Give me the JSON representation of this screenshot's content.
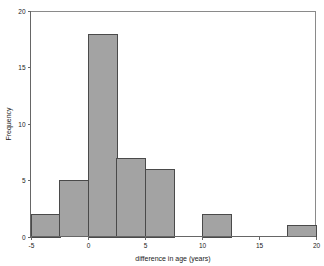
{
  "chart_data": {
    "type": "bar",
    "title": "",
    "subtitle": "",
    "xlabel": "difference in age (years)",
    "ylabel": "Frequency",
    "xlim": [
      -5,
      20
    ],
    "ylim": [
      0,
      20
    ],
    "xticks": [
      -5,
      0,
      5,
      10,
      15,
      20
    ],
    "xtick_labels": [
      "-5",
      "0",
      "5",
      "10",
      "15",
      "20"
    ],
    "yticks": [
      0,
      5,
      10,
      15,
      20
    ],
    "ytick_labels": [
      "0",
      "5",
      "10",
      "15",
      "20"
    ],
    "grid": false,
    "legend": null,
    "bin_width": 2.5,
    "bin_edges": [
      -5,
      -2.5,
      0,
      2.5,
      5,
      7.5,
      10,
      12.5,
      15,
      17.5,
      20
    ],
    "categories": [
      "-5 to -2.5",
      "-2.5 to 0",
      "0 to 2.5",
      "2.5 to 5",
      "5 to 7.5",
      "7.5 to 10",
      "10 to 12.5",
      "12.5 to 15",
      "15 to 17.5",
      "17.5 to 20"
    ],
    "values": [
      2,
      5,
      18,
      7,
      6,
      0,
      2,
      0,
      0,
      1
    ],
    "bars": [
      {
        "x0": -5,
        "x1": -2.5,
        "value": 2
      },
      {
        "x0": -2.5,
        "x1": 0,
        "value": 5
      },
      {
        "x0": 0,
        "x1": 2.5,
        "value": 18
      },
      {
        "x0": 2.5,
        "x1": 5,
        "value": 7
      },
      {
        "x0": 5,
        "x1": 7.5,
        "value": 6
      },
      {
        "x0": 7.5,
        "x1": 10,
        "value": 0
      },
      {
        "x0": 10,
        "x1": 12.5,
        "value": 2
      },
      {
        "x0": 12.5,
        "x1": 15,
        "value": 0
      },
      {
        "x0": 15,
        "x1": 17.5,
        "value": 0
      },
      {
        "x0": 17.5,
        "x1": 20,
        "value": 1
      }
    ],
    "bar_fill_color": "#a3a3a3",
    "bar_edge_color": "#4a4a4a",
    "axis_color": "#666666",
    "background_color": "#ffffff"
  }
}
